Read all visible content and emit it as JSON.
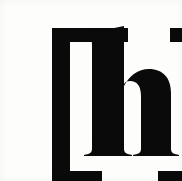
{
  "image": {
    "kind": "scanned-typographic-specimen",
    "width": 182,
    "height": 181,
    "background_color": "#fdfdfc",
    "ink_color": "#0a0a0a",
    "caption": "[h]"
  },
  "glyph": {
    "text": "[h]",
    "letter": "h",
    "letter_case": "lowercase",
    "open_bracket": "[",
    "close_bracket": "]",
    "style": "serif",
    "weight": "bold",
    "description": "Lowercase serif letter h enclosed in square brackets"
  },
  "layout": {
    "left_bracket": {
      "stem_x": 12,
      "stem_width": 18,
      "top_y": 12,
      "bottom_y": 169,
      "top_arm_right_x": 88,
      "bottom_arm_right_x": 62,
      "arm_thickness": 14
    },
    "right_bracket": {
      "stem_x": 153,
      "stem_width": 19,
      "top_y": 12,
      "bottom_y": 169,
      "top_arm_left_x": 130,
      "bottom_arm_left_x": 118,
      "arm_thickness": 14
    },
    "letter_h": {
      "left_stem_x": 48,
      "left_stem_width": 15,
      "right_stem_x": 108,
      "right_stem_width": 15,
      "ascender_top_y": 16,
      "x_height_top_y": 56,
      "baseline_y": 140,
      "serif_width": 40,
      "serif_height": 10
    }
  }
}
